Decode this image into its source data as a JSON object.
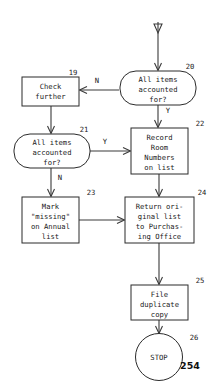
{
  "document": {
    "kind": "flowchart",
    "page_number": "254",
    "ink_color": "#2b2b2b",
    "background_color": "#ffffff"
  },
  "nodes": [
    {
      "id": "n20",
      "number": "20",
      "shape": "stadium",
      "role": "decision",
      "lines": [
        "All items",
        "accounted",
        "for?"
      ],
      "x": 120,
      "y": 71,
      "w": 76,
      "h": 34
    },
    {
      "id": "n19",
      "number": "19",
      "shape": "rectangle",
      "role": "process",
      "lines": [
        "Check",
        "further"
      ],
      "x": 22,
      "y": 77,
      "w": 57,
      "h": 29
    },
    {
      "id": "n21",
      "number": "21",
      "shape": "stadium",
      "role": "decision",
      "lines": [
        "All items",
        "accounted",
        "for?"
      ],
      "x": 14,
      "y": 134,
      "w": 76,
      "h": 34
    },
    {
      "id": "n22",
      "number": "22",
      "shape": "rectangle",
      "role": "process",
      "lines": [
        "Record",
        "Room",
        "Numbers",
        "on list"
      ],
      "x": 131,
      "y": 128,
      "w": 57,
      "h": 46
    },
    {
      "id": "n23",
      "number": "23",
      "shape": "rectangle",
      "role": "process",
      "lines": [
        "Mark",
        "\"missing\"",
        "on Annual",
        "list"
      ],
      "x": 22,
      "y": 197,
      "w": 57,
      "h": 46
    },
    {
      "id": "n24",
      "number": "24",
      "shape": "rectangle",
      "role": "process",
      "lines": [
        "Return ori-",
        "ginal list",
        "to Purchas-",
        "ing Office"
      ],
      "x": 125,
      "y": 197,
      "w": 69,
      "h": 46
    },
    {
      "id": "n25",
      "number": "25",
      "shape": "rectangle",
      "role": "process",
      "lines": [
        "File",
        "duplicate",
        "copy"
      ],
      "x": 131,
      "y": 285,
      "w": 57,
      "h": 35
    },
    {
      "id": "n26",
      "number": "26",
      "shape": "circle",
      "role": "terminator",
      "lines": [
        "STOP"
      ],
      "x": 136,
      "y": 334,
      "w": 47,
      "h": 47
    }
  ],
  "edges": [
    {
      "id": "e-entry-20",
      "from": "page-connector",
      "to": "n20",
      "label": ""
    },
    {
      "id": "e-20-19",
      "from": "n20",
      "to": "n19",
      "label": "N"
    },
    {
      "id": "e-20-22",
      "from": "n20",
      "to": "n22",
      "label": "Y"
    },
    {
      "id": "e-19-21",
      "from": "n19",
      "to": "n21",
      "label": ""
    },
    {
      "id": "e-21-22",
      "from": "n21",
      "to": "n22",
      "label": "Y"
    },
    {
      "id": "e-21-23",
      "from": "n21",
      "to": "n23",
      "label": "N"
    },
    {
      "id": "e-22-24",
      "from": "n22",
      "to": "n24",
      "label": ""
    },
    {
      "id": "e-23-24",
      "from": "n23",
      "to": "n24",
      "label": ""
    },
    {
      "id": "e-24-25",
      "from": "n24",
      "to": "n25",
      "label": ""
    },
    {
      "id": "e-25-26",
      "from": "n25",
      "to": "n26",
      "label": ""
    }
  ],
  "edge_labels": {
    "n20_no": "N",
    "n20_yes": "Y",
    "n21_yes": "Y",
    "n21_no": "N"
  },
  "node_text": {
    "n19": {
      "l1": "Check",
      "l2": "further",
      "num": "19"
    },
    "n20": {
      "l1": "All items",
      "l2": "accounted",
      "l3": "for?",
      "num": "20"
    },
    "n21": {
      "l1": "All items",
      "l2": "accounted",
      "l3": "for?",
      "num": "21"
    },
    "n22": {
      "l1": "Record",
      "l2": "Room",
      "l3": "Numbers",
      "l4": "on list",
      "num": "22"
    },
    "n23": {
      "l1": "Mark",
      "l2": "\"missing\"",
      "l3": "on Annual",
      "l4": "list",
      "num": "23"
    },
    "n24": {
      "l1": "Return ori-",
      "l2": "ginal list",
      "l3": "to Purchas-",
      "l4": "ing Office",
      "num": "24"
    },
    "n25": {
      "l1": "File",
      "l2": "duplicate",
      "l3": "copy",
      "num": "25"
    },
    "n26": {
      "l1": "STOP",
      "num": "26"
    }
  },
  "footer": {
    "page_number": "254"
  }
}
